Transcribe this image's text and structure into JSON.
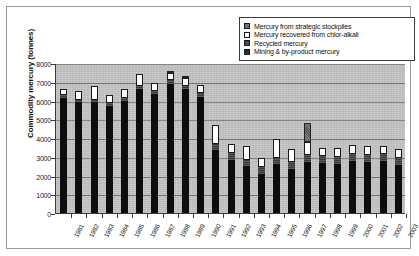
{
  "chart_data": {
    "type": "bar",
    "stacked": true,
    "title": "",
    "xlabel": "",
    "ylabel": "Commodity mercury (tonnes)",
    "ylim": [
      0,
      8000
    ],
    "ytick_step": 1000,
    "yticks": [
      "0",
      "1000",
      "2000",
      "3000",
      "4000",
      "5000",
      "6000",
      "7000",
      "8000"
    ],
    "grid": true,
    "legend_position": "top-right",
    "categories": [
      "1981",
      "1982",
      "1983",
      "1984",
      "1985",
      "1986",
      "1987",
      "1988",
      "1989",
      "1990",
      "1991",
      "1992",
      "1993",
      "1994",
      "1995",
      "1996",
      "1997",
      "1998",
      "1999",
      "2000",
      "2001",
      "2002",
      "2003"
    ],
    "series": [
      {
        "name": "Mining & by-product mercury",
        "color": "#0d0d0d",
        "values": [
          6150,
          5900,
          5900,
          5700,
          6000,
          6600,
          6350,
          6900,
          6600,
          6200,
          3350,
          2850,
          2500,
          2100,
          2600,
          2350,
          2700,
          2650,
          2600,
          2750,
          2700,
          2750,
          2550
        ]
      },
      {
        "name": "Recycled mercury",
        "color": "#4a4a4a",
        "values": [
          150,
          150,
          150,
          150,
          150,
          150,
          150,
          200,
          200,
          200,
          350,
          350,
          350,
          350,
          350,
          350,
          400,
          400,
          400,
          400,
          400,
          400,
          400
        ]
      },
      {
        "name": "Mercury recovered from chlor-alkali",
        "color": "#ffffff",
        "values": [
          300,
          450,
          700,
          450,
          450,
          650,
          450,
          350,
          400,
          450,
          1000,
          500,
          750,
          500,
          1000,
          700,
          700,
          400,
          450,
          500,
          500,
          450,
          450
        ]
      },
      {
        "name": "Mercury from strategic stockpiles",
        "color": "#6e6e6e",
        "values": [
          0,
          0,
          0,
          0,
          0,
          0,
          0,
          100,
          50,
          0,
          0,
          0,
          0,
          0,
          0,
          0,
          1000,
          0,
          0,
          0,
          0,
          0,
          0
        ]
      }
    ],
    "totals": [
      6600,
      6500,
      6750,
      6300,
      6600,
      7400,
      6950,
      7550,
      7250,
      6850,
      4700,
      3700,
      3600,
      2950,
      3950,
      3400,
      4800,
      3450,
      3450,
      3650,
      3600,
      3600,
      3400
    ],
    "legend": [
      {
        "label": "Mercury from strategic stockpiles",
        "swatch": "sw-stock"
      },
      {
        "label": "Mercury recovered from chlor-alkali",
        "swatch": "sw-chlor"
      },
      {
        "label": "Recycled mercury",
        "swatch": "sw-recycled"
      },
      {
        "label": "Mining & by-product mercury",
        "swatch": "sw-mining"
      }
    ]
  }
}
